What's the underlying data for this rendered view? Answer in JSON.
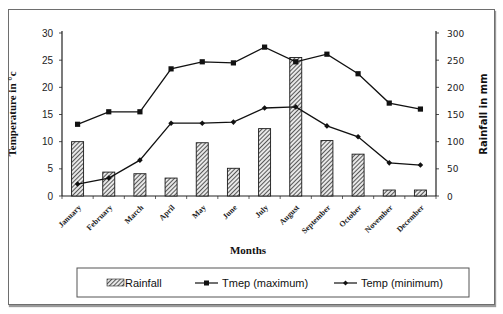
{
  "chart_data": {
    "type": "bar+line",
    "title": "",
    "categories": [
      "January",
      "February",
      "March",
      "April",
      "May",
      "June",
      "July",
      "August",
      "September",
      "October",
      "November",
      "December"
    ],
    "xlabel": "Months",
    "ylabel_left": "Temperature in °c",
    "ylabel_right": "Rainfall in mm",
    "ylim_left": [
      0,
      30
    ],
    "yticks_left": [
      0,
      5,
      10,
      15,
      20,
      25,
      30
    ],
    "ylim_right": [
      0,
      300
    ],
    "yticks_right": [
      0,
      50,
      100,
      150,
      200,
      250,
      300
    ],
    "grid": false,
    "legend_position": "bottom",
    "series": [
      {
        "name": "Rainfall",
        "type": "bar",
        "axis": "right",
        "values": [
          100,
          44,
          41,
          33,
          98,
          51,
          124,
          255,
          102,
          77,
          11,
          11
        ]
      },
      {
        "name": "Tmep (maximum)",
        "type": "line",
        "marker": "square",
        "axis": "left",
        "values": [
          13.2,
          15.5,
          15.5,
          23.4,
          24.7,
          24.5,
          27.4,
          24.7,
          26.1,
          22.5,
          17.1,
          16.0
        ]
      },
      {
        "name": "Temp (minimum)",
        "type": "line",
        "marker": "diamond",
        "axis": "left",
        "values": [
          2.2,
          3.3,
          6.6,
          13.4,
          13.4,
          13.6,
          16.2,
          16.4,
          12.9,
          10.9,
          6.1,
          5.7
        ]
      }
    ]
  },
  "legend": {
    "rainfall": "Rainfall",
    "tmax": "Tmep (maximum)",
    "tmin": "Temp (minimum)"
  },
  "axes": {
    "xlabel": "Months",
    "ylabel_left": "Temperature in °c",
    "ylabel_right": "Rainfall in mm"
  }
}
